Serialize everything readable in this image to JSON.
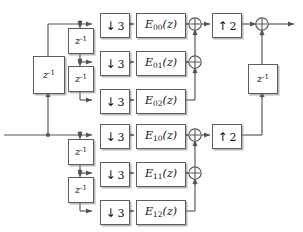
{
  "diagram": {
    "type": "signal-flow-block-diagram",
    "colors": {
      "line": "#555555",
      "box_border": "#5d5d5d",
      "box_fill": "#ffffff",
      "shadow": "#828282",
      "background": "#ffffff",
      "text": "#111111"
    },
    "downsamplers": [
      {
        "id": "down-00",
        "arrow": "↓",
        "factor": "3",
        "label": "↓ 3",
        "x": 100,
        "y": 13
      },
      {
        "id": "down-01",
        "arrow": "↓",
        "factor": "3",
        "label": "↓ 3",
        "x": 100,
        "y": 51
      },
      {
        "id": "down-02",
        "arrow": "↓",
        "factor": "3",
        "label": "↓ 3",
        "x": 100,
        "y": 89
      },
      {
        "id": "down-10",
        "arrow": "↓",
        "factor": "3",
        "label": "↓ 3",
        "x": 100,
        "y": 124
      },
      {
        "id": "down-11",
        "arrow": "↓",
        "factor": "3",
        "label": "↓ 3",
        "x": 100,
        "y": 162
      },
      {
        "id": "down-12",
        "arrow": "↓",
        "factor": "3",
        "label": "↓ 3",
        "x": 100,
        "y": 200
      }
    ],
    "upsamplers": [
      {
        "id": "up-top",
        "arrow": "↑",
        "factor": "2",
        "label": "↑ 2",
        "x": 212,
        "y": 13
      },
      {
        "id": "up-bottom",
        "arrow": "↑",
        "factor": "2",
        "label": "↑ 2",
        "x": 212,
        "y": 124
      }
    ],
    "filters": [
      {
        "id": "E00",
        "base": "E",
        "sub": "00",
        "arg": "(z)",
        "label": "E00(z)",
        "x": 136,
        "y": 13
      },
      {
        "id": "E01",
        "base": "E",
        "sub": "01",
        "arg": "(z)",
        "label": "E01(z)",
        "x": 136,
        "y": 51
      },
      {
        "id": "E02",
        "base": "E",
        "sub": "02",
        "arg": "(z)",
        "label": "E02(z)",
        "x": 136,
        "y": 89
      },
      {
        "id": "E10",
        "base": "E",
        "sub": "10",
        "arg": "(z)",
        "label": "E10(z)",
        "x": 136,
        "y": 124
      },
      {
        "id": "E11",
        "base": "E",
        "sub": "11",
        "arg": "(z)",
        "label": "E11(z)",
        "x": 136,
        "y": 162
      },
      {
        "id": "E12",
        "base": "E",
        "sub": "12",
        "arg": "(z)",
        "label": "E12(z)",
        "x": 136,
        "y": 200
      }
    ],
    "delays": [
      {
        "id": "delay-main",
        "base": "z",
        "exp": "-1",
        "label": "z^-1",
        "x": 33,
        "y": 56
      },
      {
        "id": "delay-top-1",
        "base": "z",
        "exp": "-1",
        "label": "z^-1",
        "x": 68,
        "y": 28
      },
      {
        "id": "delay-top-2",
        "base": "z",
        "exp": "-1",
        "label": "z^-1",
        "x": 68,
        "y": 66
      },
      {
        "id": "delay-bot-1",
        "base": "z",
        "exp": "-1",
        "label": "z^-1",
        "x": 68,
        "y": 139
      },
      {
        "id": "delay-bot-2",
        "base": "z",
        "exp": "-1",
        "label": "z^-1",
        "x": 68,
        "y": 177
      },
      {
        "id": "delay-output",
        "base": "z",
        "exp": "-1",
        "label": "z^-1",
        "x": 248,
        "y": 64
      }
    ],
    "adders": [
      {
        "id": "adder-top-1",
        "symbol": "+",
        "cx": 195,
        "cy": 24
      },
      {
        "id": "adder-top-2",
        "symbol": "+",
        "cx": 195,
        "cy": 62
      },
      {
        "id": "adder-bot-1",
        "symbol": "+",
        "cx": 195,
        "cy": 135
      },
      {
        "id": "adder-bot-2",
        "symbol": "+",
        "cx": 195,
        "cy": 173
      },
      {
        "id": "adder-output",
        "symbol": "+",
        "cx": 262,
        "cy": 24
      }
    ]
  }
}
